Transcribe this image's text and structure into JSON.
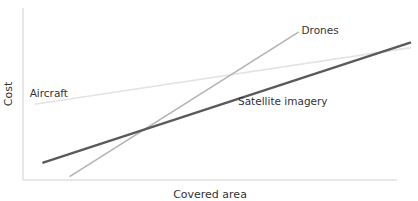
{
  "chart_data": {
    "type": "line",
    "title": "",
    "xlabel": "Covered area",
    "ylabel": "Cost",
    "xlim": [
      0,
      10
    ],
    "ylim": [
      0,
      10
    ],
    "grid": false,
    "legend": "inline labels",
    "series": [
      {
        "name": "Aircraft",
        "label": "Aircraft",
        "color": "#e3e3e3",
        "x": [
          0.3,
          10
        ],
        "y": [
          4.4,
          7.7
        ]
      },
      {
        "name": "Satellite imagery",
        "label": "Satellite imagery",
        "color": "#5a5a5a",
        "x": [
          0.5,
          10
        ],
        "y": [
          1.0,
          8.0
        ]
      },
      {
        "name": "Drones",
        "label": "Drones",
        "color": "#b3b3b3",
        "x": [
          1.2,
          7.1
        ],
        "y": [
          0.2,
          8.6
        ]
      }
    ]
  }
}
